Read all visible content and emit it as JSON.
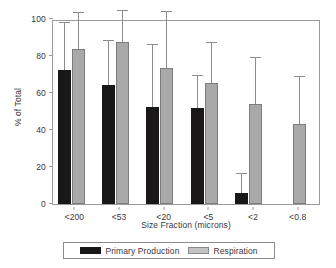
{
  "chart_data": {
    "type": "bar",
    "title": "",
    "xlabel": "Size Fraction (microns)",
    "ylabel": "% of Total",
    "categories": [
      "<200",
      "<53",
      "<20",
      "<5",
      "<2",
      "<0.8"
    ],
    "ylim": [
      0,
      100
    ],
    "yticks": [
      0,
      20,
      40,
      60,
      80,
      100
    ],
    "grid": false,
    "legend_position": "bottom",
    "series": [
      {
        "name": "Primary Production",
        "color": "#1a1718",
        "values": [
          72.5,
          64.6,
          52.3,
          52.0,
          5.8,
          null
        ],
        "errors_upper": [
          98.0,
          88.0,
          86.0,
          69.0,
          16.0,
          null
        ]
      },
      {
        "name": "Respiration",
        "color": "#a9a9a9",
        "values": [
          83.7,
          87.6,
          73.5,
          65.2,
          54.3,
          43.2
        ],
        "errors_upper": [
          103.5,
          104.5,
          104.0,
          87.0,
          78.8,
          68.5
        ]
      }
    ]
  },
  "axes": {
    "ylabel": "% of Total",
    "xlabel": "Size Fraction (microns)",
    "ytick_labels": [
      "0",
      "20",
      "40",
      "60",
      "80",
      "100"
    ],
    "xtick_labels": [
      "<200",
      "<53",
      "<20",
      "<5",
      "<2",
      "<0.8"
    ]
  },
  "legend": {
    "items": [
      {
        "label": "Primary Production",
        "color": "#1a1718"
      },
      {
        "label": "Respiration",
        "color": "#c3c3c3"
      }
    ]
  },
  "colors": {
    "primary_production": "#1a1718",
    "respiration": "#a9a9a9",
    "axis": "#9a9a9a",
    "text": "#3a3637",
    "error_bar": "#8c8c8c"
  }
}
